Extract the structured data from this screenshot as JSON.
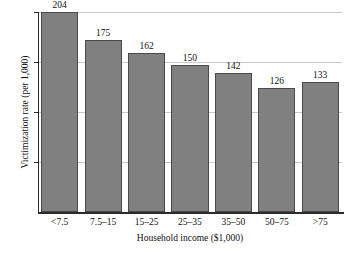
{
  "chart_data": {
    "type": "bar",
    "title": "",
    "xlabel": "Household income ($1,000)",
    "ylabel": "Victimization rate (per 1,000)",
    "categories": [
      "<7.5",
      "7.5–15",
      "15–25",
      "25–35",
      "35–50",
      "50–75",
      ">75"
    ],
    "values": [
      204,
      175,
      162,
      150,
      142,
      126,
      133
    ],
    "value_labels": [
      "204",
      "175",
      "162",
      "150",
      "142",
      "126",
      "133"
    ],
    "ylim": [
      0,
      204
    ],
    "yticks": [
      54,
      104,
      154,
      204
    ],
    "ytick_labels": [],
    "grid": true,
    "legend": null,
    "series": [
      {
        "name": "Victimization rate",
        "values": [
          204,
          175,
          162,
          150,
          142,
          126,
          133
        ]
      }
    ],
    "colors": {
      "bar_fill": "#808080",
      "bar_edge": "#4a4a4a",
      "gridline": "#c9c9c9",
      "axis": "#2b2b2b",
      "text": "#111111",
      "background": "#ffffff"
    }
  }
}
